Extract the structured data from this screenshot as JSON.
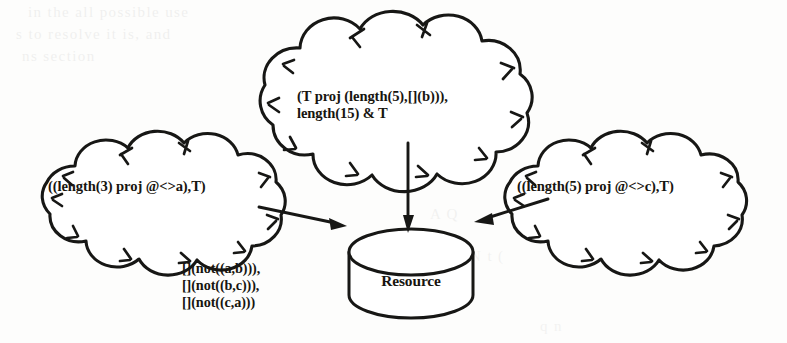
{
  "figure": {
    "clouds": [
      {
        "id": "top",
        "role": "process-cloud-top",
        "lines": [
          "(T proj (length(5),[](b))),",
          "length(15) & T"
        ]
      },
      {
        "id": "left",
        "role": "process-cloud-left",
        "lines": [
          "((length(3) proj @<>a),T)"
        ]
      },
      {
        "id": "right",
        "role": "process-cloud-right",
        "lines": [
          "((length(5) proj @<>c),T)"
        ]
      }
    ],
    "resource": {
      "label": "Resource"
    },
    "constraints": {
      "lines": [
        "[](not((a,b))),",
        "[](not((b,c))),",
        "[](not((c,a)))"
      ]
    },
    "arrows": [
      {
        "id": "left-to-resource",
        "from": "left-cloud",
        "to": "resource"
      },
      {
        "id": "top-to-resource",
        "from": "top-cloud",
        "to": "resource"
      },
      {
        "id": "right-to-resource",
        "from": "right-cloud",
        "to": "resource"
      }
    ],
    "background_bleed": [
      "in the all possible use",
      "s to resolve it is, and",
      "ns section",
      "A Q",
      "N t (",
      "q n"
    ],
    "colors": {
      "ink": "#171715",
      "paper": "#fdfdfc"
    }
  }
}
